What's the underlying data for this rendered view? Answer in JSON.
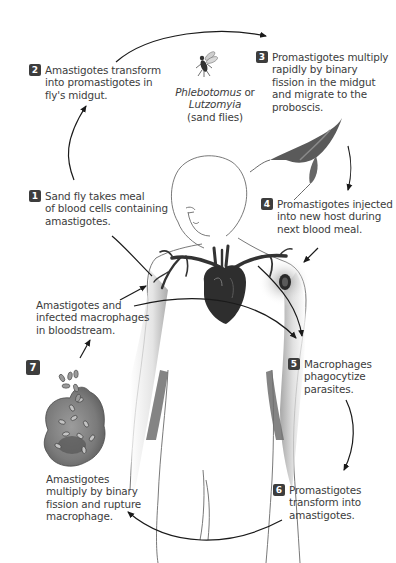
{
  "diagram": {
    "type": "life-cycle",
    "vector": {
      "name_line1": "Phlebotomus",
      "name_line1_suffix": " or",
      "name_line2": "Lutzomyia",
      "name_line3": "(sand flies)"
    },
    "steps": [
      {
        "number": "1",
        "lines": [
          "Sand fly takes meal",
          "of blood cells containing",
          "amastigotes."
        ]
      },
      {
        "number": "2",
        "lines": [
          "Amastigotes transform",
          "into promastigotes in",
          "fly's midgut."
        ]
      },
      {
        "number": "3",
        "lines": [
          "Promastigotes multiply",
          "rapidly by binary",
          "fission in the midgut",
          "and migrate to the",
          "proboscis."
        ]
      },
      {
        "number": "4",
        "lines": [
          "Promastigotes injected",
          "into new host during",
          "next blood meal."
        ]
      },
      {
        "number": "5",
        "lines": [
          "Macrophages",
          "phagocytize",
          "parasites."
        ]
      },
      {
        "number": "6",
        "lines": [
          "Promastigotes",
          "transform into",
          "amastigotes."
        ]
      },
      {
        "number": "7",
        "lines": [
          "Amastigotes",
          "multiply by binary",
          "fission and rupture",
          "macrophage."
        ]
      }
    ],
    "unnumbered_labels": [
      {
        "id": "bloodstream",
        "lines": [
          "Amastigotes and",
          "infected macrophages",
          "in bloodstream."
        ]
      }
    ],
    "colors": {
      "badge": "#3d3d3d",
      "text": "#3c3c3c",
      "arrow": "#1a1a1a",
      "outline": "#555555",
      "heart": "#2e2e2e",
      "shade": "#8a8a8a"
    }
  }
}
